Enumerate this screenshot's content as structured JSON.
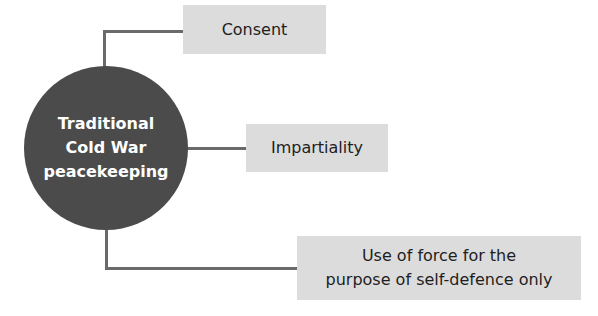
{
  "diagram": {
    "center": {
      "lines": [
        "Traditional",
        "Cold War",
        "peacekeeping"
      ]
    },
    "branches": [
      {
        "label": "Consent"
      },
      {
        "label": "Impartiality"
      },
      {
        "lines": [
          "Use of force for the",
          "purpose of self-defence only"
        ]
      }
    ],
    "colors": {
      "circle": "#4b4b4b",
      "box": "#dcdcdc",
      "connector": "#6a6a6a",
      "circle_text": "#ffffff",
      "box_text": "#1e1e1e"
    }
  }
}
